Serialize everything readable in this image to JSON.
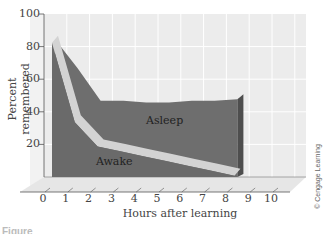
{
  "chart_data": {
    "type": "area",
    "title": "",
    "xlabel": "Hours after learning",
    "ylabel": "Percent remembered",
    "xlim": [
      0,
      10
    ],
    "ylim": [
      0,
      100
    ],
    "x_ticks": [
      "0",
      "1",
      "2",
      "3",
      "4",
      "5",
      "6",
      "7",
      "8",
      "9",
      "10"
    ],
    "y_ticks": [
      "20",
      "40",
      "60",
      "80",
      "100"
    ],
    "grid": true,
    "style": "3d",
    "series": [
      {
        "name": "Asleep",
        "x": [
          0,
          1,
          2,
          3,
          4,
          5,
          6,
          7,
          8
        ],
        "values": [
          85,
          67,
          47,
          47,
          46,
          46,
          47,
          47,
          48
        ],
        "color": "#6e6e6e"
      },
      {
        "name": "Awake",
        "x": [
          0,
          1,
          2,
          3,
          4,
          5,
          6,
          7,
          8
        ],
        "values": [
          85,
          36,
          21,
          18,
          15,
          12,
          9,
          6,
          3
        ],
        "color": "#d0d0d0"
      }
    ],
    "annotations": [
      "Asleep",
      "Awake"
    ],
    "legend_position": "none"
  },
  "labels": {
    "asleep": "Asleep",
    "awake": "Awake",
    "copyright": "© Cengage Learning",
    "caption_partial": "Figure"
  },
  "colors": {
    "back_panel": "#ececec",
    "grid": "#ffffff",
    "area_dark": "#6e6e6e",
    "area_side": "#4e4e4e",
    "awake_band": "#d3d3d3",
    "floor": "#e4e4e4",
    "axis": "#555555"
  }
}
